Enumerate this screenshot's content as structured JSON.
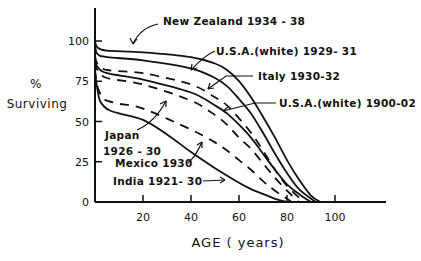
{
  "chart_data": {
    "type": "line",
    "title": "",
    "xlabel": "AGE ( years)",
    "ylabel_line1": "%",
    "ylabel_line2": "Surviving",
    "xlim": [
      0,
      118
    ],
    "ylim": [
      0,
      120
    ],
    "xticks": [
      20,
      40,
      60,
      80,
      100
    ],
    "yticks": [
      0,
      25,
      50,
      75,
      100
    ],
    "grid": false,
    "legend": "inline annotations with arrows",
    "series": [
      {
        "name": "New Zealand 1934-38",
        "style": "solid",
        "x": [
          0,
          1,
          5,
          20,
          40,
          50,
          55,
          60,
          65,
          70,
          75,
          80,
          85,
          90,
          94
        ],
        "y": [
          100,
          96,
          94,
          93,
          90,
          86,
          82,
          75,
          65,
          53,
          40,
          26,
          14,
          4,
          0
        ]
      },
      {
        "name": "U.S.A.(white) 1929-31",
        "style": "solid",
        "x": [
          0,
          1,
          5,
          20,
          40,
          50,
          55,
          60,
          65,
          70,
          75,
          80,
          85,
          92
        ],
        "y": [
          98,
          92,
          90,
          88,
          83,
          77,
          72,
          64,
          55,
          43,
          30,
          18,
          8,
          0
        ]
      },
      {
        "name": "Italy 1930-32",
        "style": "dashed",
        "x": [
          0,
          1,
          5,
          20,
          40,
          50,
          55,
          60,
          65,
          70,
          75,
          80,
          87
        ],
        "y": [
          91,
          86,
          82,
          80,
          73,
          65,
          60,
          52,
          43,
          32,
          20,
          10,
          0
        ]
      },
      {
        "name": "U.S.A.(white) 1900-02",
        "style": "solid",
        "x": [
          0,
          1,
          5,
          20,
          40,
          50,
          55,
          60,
          65,
          70,
          75,
          80,
          85,
          90
        ],
        "y": [
          89,
          84,
          80,
          76,
          68,
          60,
          55,
          48,
          40,
          30,
          20,
          11,
          5,
          0
        ]
      },
      {
        "name": "Japan 1926-30",
        "style": "dashed",
        "x": [
          0,
          1,
          5,
          20,
          40,
          50,
          55,
          60,
          65,
          70,
          75,
          80,
          85
        ],
        "y": [
          87,
          82,
          77,
          73,
          63,
          54,
          48,
          40,
          33,
          24,
          15,
          7,
          0
        ]
      },
      {
        "name": "Mexico 1930",
        "style": "dashed",
        "x": [
          0,
          1,
          3,
          5,
          10,
          20,
          40,
          50,
          55,
          60,
          65,
          70,
          75,
          82
        ],
        "y": [
          82,
          72,
          65,
          63,
          61,
          58,
          45,
          37,
          32,
          26,
          20,
          13,
          7,
          0
        ]
      },
      {
        "name": "India 1921-30",
        "style": "solid",
        "x": [
          0,
          1,
          2,
          4,
          6,
          10,
          20,
          30,
          40,
          50,
          60,
          65,
          70,
          75,
          80
        ],
        "y": [
          80,
          70,
          63,
          59,
          57,
          55,
          51,
          42,
          31,
          21,
          12,
          8,
          5,
          2,
          0
        ]
      }
    ]
  },
  "annotations": {
    "new_zealand": "New Zealand  1934 - 38",
    "usa_1929": "U.S.A.(white) 1929- 31",
    "italy": "Italy  1930-32",
    "usa_1900": "U.S.A.(white) 1900-02",
    "japan_line1": "Japan",
    "japan_line2": "1926 - 30",
    "mexico": "Mexico 1930",
    "india": "India 1921- 30"
  },
  "axes": {
    "x_tick_labels": [
      "20",
      "40",
      "60",
      "80",
      "100"
    ],
    "y_tick_labels": [
      "0",
      "25",
      "50",
      "75",
      "100"
    ],
    "x_title": "AGE ( years)",
    "y_title_line1": "%",
    "y_title_line2": "Surviving"
  },
  "colors": {
    "ink": "#111111",
    "background": "#ffffff"
  }
}
